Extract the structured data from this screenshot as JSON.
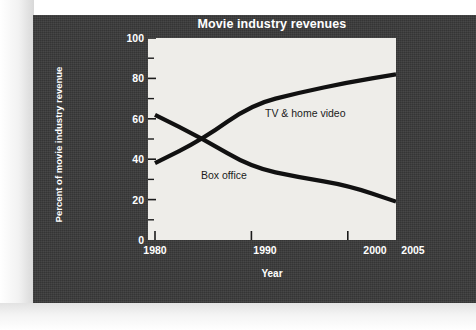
{
  "chart_data": {
    "type": "line",
    "title": "Movie industry revenues",
    "xlabel": "Year",
    "ylabel": "Percent of movie industry revenue",
    "xlim": [
      1980,
      2005
    ],
    "ylim": [
      0,
      100
    ],
    "xticks": [
      1980,
      1990,
      2000,
      2005
    ],
    "xtick_labels": [
      "1980",
      "1990",
      "2000",
      "2005"
    ],
    "yticks": [
      0,
      20,
      40,
      60,
      80,
      100
    ],
    "ytick_labels": [
      "0",
      "20",
      "40",
      "60",
      "80",
      "100"
    ],
    "minor_yticks": [
      10,
      30,
      50,
      70,
      90
    ],
    "grid": false,
    "legend": "inline-labels",
    "series": [
      {
        "name": "TV & home video",
        "label_text": "TV & home video",
        "color": "#111111",
        "x": [
          1980,
          1985,
          1990,
          1995,
          2000,
          2005
        ],
        "values": [
          38,
          50,
          67,
          73,
          78,
          82
        ]
      },
      {
        "name": "Box office",
        "label_text": "Box office",
        "color": "#111111",
        "x": [
          1980,
          1985,
          1990,
          1995,
          2000,
          2005
        ],
        "values": [
          62,
          50,
          36,
          31,
          27,
          19
        ]
      }
    ],
    "annotations": [
      {
        "text": "TV & home video",
        "x": 1992.5,
        "y": 57
      },
      {
        "text": "Box office",
        "x": 1987.5,
        "y": 30
      }
    ]
  },
  "figure": {
    "panel_color": "#3a3a3a",
    "plot_background": "#eeede9",
    "text_color": "#ffffff",
    "line_color": "#111111"
  }
}
